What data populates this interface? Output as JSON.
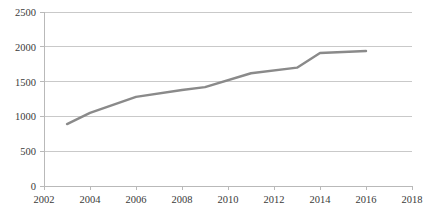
{
  "chart_data": {
    "type": "line",
    "title": "",
    "subtitle": "",
    "xlabel": "",
    "ylabel": "",
    "grid": true,
    "gridlines": "horizontal",
    "legend": "none",
    "series_color": "#8a8a8a",
    "axis_color": "#b9b9b9",
    "grid_color": "#c9c9c9",
    "text_color": "#3a3a3a",
    "xlim": [
      2002,
      2018
    ],
    "ylim": [
      0,
      2500
    ],
    "x_ticks": [
      2002,
      2004,
      2006,
      2008,
      2010,
      2012,
      2014,
      2016,
      2018
    ],
    "x_tick_labels": [
      "2002",
      "2004",
      "2006",
      "2008",
      "2010",
      "2012",
      "2014",
      "2016",
      "2018"
    ],
    "y_ticks": [
      0,
      500,
      1000,
      1500,
      2000,
      2500
    ],
    "y_tick_labels": [
      "0",
      "500",
      "1000",
      "1500",
      "2000",
      "2500"
    ],
    "series": [
      {
        "name": "series-1",
        "color": "#8a8a8a",
        "x": [
          2003,
          2004,
          2006,
          2008,
          2009,
          2011,
          2013,
          2014,
          2016
        ],
        "values": [
          890,
          1050,
          1280,
          1380,
          1420,
          1620,
          1700,
          1910,
          1940
        ]
      }
    ]
  }
}
